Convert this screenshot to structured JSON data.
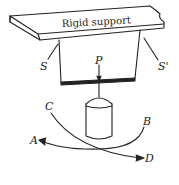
{
  "diagram": {
    "support_label": "Rigid support",
    "labels": {
      "S": "S",
      "S_prime": "S'",
      "P": "P",
      "A": "A",
      "B": "B",
      "C": "C",
      "D": "D"
    },
    "colors": {
      "line": "#222222",
      "background": "#ffffff"
    }
  }
}
